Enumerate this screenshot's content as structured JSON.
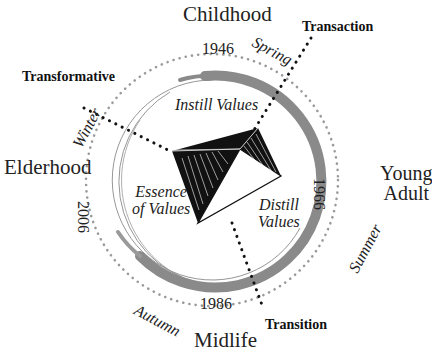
{
  "diagram": {
    "stages": {
      "top": "Childhood",
      "right_line1": "Young",
      "right_line2": "Adult",
      "bottom": "Midlife",
      "left": "Elderhood"
    },
    "years": {
      "top": "1946",
      "right": "1966",
      "bottom": "1986",
      "left": "2006"
    },
    "seasons": {
      "spring": "Spring",
      "summer": "Summer",
      "autumn": "Autumn",
      "winter": "Winter"
    },
    "modes": {
      "transaction": "Transaction",
      "transition": "Transition",
      "transformative": "Transformative"
    },
    "values": {
      "instill": "Instill Values",
      "essence_line1": "Essence",
      "essence_line2": "of Values",
      "distill_line1": "Distill",
      "distill_line2": "Values"
    },
    "colors": {
      "ring_stroke": "#8a8a8a",
      "dots": "#9a9a9a",
      "leader_dots": "#111111",
      "pyramid": "#111111"
    }
  }
}
